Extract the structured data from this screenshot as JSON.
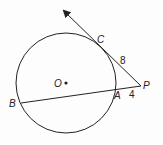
{
  "diagram": {
    "type": "geometry-circle-tangent-secant",
    "points": {
      "O": "O",
      "C": "C",
      "P": "P",
      "A": "A",
      "B": "B"
    },
    "lengths": {
      "PC": "8",
      "PA": "4"
    },
    "colors": {
      "stroke": "#222222",
      "background": "#fdfdfd"
    }
  }
}
